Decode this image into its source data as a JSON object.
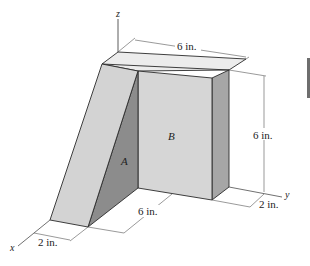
{
  "figure": {
    "parts": [
      {
        "id": "A",
        "label": "A",
        "shape": "triangular wedge"
      },
      {
        "id": "B",
        "label": "B",
        "shape": "rectangular block"
      }
    ],
    "axes": {
      "x": "x",
      "y": "y",
      "z": "z"
    },
    "dimensions": {
      "top_width": "6 in.",
      "height": "6 in.",
      "depth_right": "2 in.",
      "base_length": "6 in.",
      "base_width": "2 in."
    },
    "colors": {
      "face_light": "#d9d9d9",
      "face_top": "#ececec",
      "face_mid": "#c9c9c9",
      "face_dark": "#8c8c8c",
      "face_side": "#a6a6a6",
      "edge": "#2a2a2a",
      "side_bar": "#6e6e6e"
    }
  }
}
